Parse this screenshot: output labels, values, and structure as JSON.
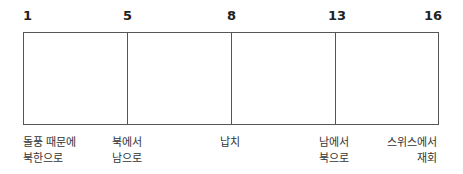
{
  "timeline": {
    "ticks": [
      {
        "label": "1"
      },
      {
        "label": "5"
      },
      {
        "label": "8"
      },
      {
        "label": "13"
      },
      {
        "label": "16"
      }
    ],
    "events": [
      {
        "line1": "돌풍 때문에",
        "line2": "북한으로"
      },
      {
        "line1": "북에서",
        "line2": "남으로"
      },
      {
        "line1": "납치",
        "line2": ""
      },
      {
        "line1": "남에서",
        "line2": "북으로"
      },
      {
        "line1": "스위스에서",
        "line2": "재회"
      }
    ],
    "colors": {
      "border": "#555555",
      "text": "#222222"
    }
  }
}
